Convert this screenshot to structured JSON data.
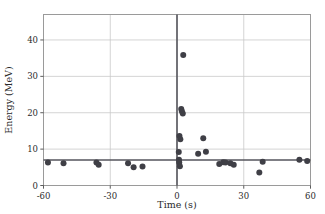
{
  "chart_data": {
    "type": "scatter",
    "title": "",
    "xlabel": "Time (s)",
    "ylabel": "Energy (MeV)",
    "xlim": [
      -60,
      60
    ],
    "ylim": [
      0,
      47
    ],
    "xticks": [
      -60,
      -30,
      0,
      30,
      60
    ],
    "xtick_labels": [
      "-60",
      "-30",
      "0",
      "30",
      "60"
    ],
    "yticks": [
      0,
      10,
      20,
      30,
      40
    ],
    "ytick_labels": [
      "0",
      "10",
      "20",
      "30",
      "40"
    ],
    "grid": true,
    "grid_color": "#c9c9c9",
    "legend": null,
    "marker_color": "#3f3f46",
    "marker_size": 4.2,
    "reference_lines": [
      {
        "name": "vertical-zero-line",
        "orientation": "vertical",
        "value": 0,
        "color": "#55555c",
        "width": 1.6
      },
      {
        "name": "horizontal-threshold-line",
        "orientation": "horizontal",
        "value": 7.0,
        "color": "#55555c",
        "width": 1.6
      }
    ],
    "series": [
      {
        "name": "events",
        "points": [
          [
            -58.0,
            6.3
          ],
          [
            -51.0,
            6.1
          ],
          [
            -36.2,
            6.3
          ],
          [
            -35.2,
            5.7
          ],
          [
            -22.0,
            6.1
          ],
          [
            -19.5,
            5.0
          ],
          [
            -15.5,
            5.2
          ],
          [
            0.8,
            9.2
          ],
          [
            0.9,
            7.1
          ],
          [
            1.0,
            6.3
          ],
          [
            1.3,
            5.3
          ],
          [
            1.1,
            13.6
          ],
          [
            1.5,
            12.7
          ],
          [
            1.9,
            21.0
          ],
          [
            2.2,
            20.4
          ],
          [
            2.6,
            19.8
          ],
          [
            2.8,
            35.9
          ],
          [
            9.5,
            8.7
          ],
          [
            11.8,
            13.0
          ],
          [
            13.0,
            9.3
          ],
          [
            19.0,
            5.9
          ],
          [
            20.8,
            6.4
          ],
          [
            21.8,
            6.3
          ],
          [
            24.0,
            6.1
          ],
          [
            25.5,
            5.7
          ],
          [
            37.0,
            3.6
          ],
          [
            38.5,
            6.5
          ],
          [
            55.0,
            7.1
          ],
          [
            58.5,
            6.7
          ]
        ]
      }
    ]
  },
  "figure": {
    "background": "#ffffff",
    "frame_color": "#9a9a9a"
  }
}
